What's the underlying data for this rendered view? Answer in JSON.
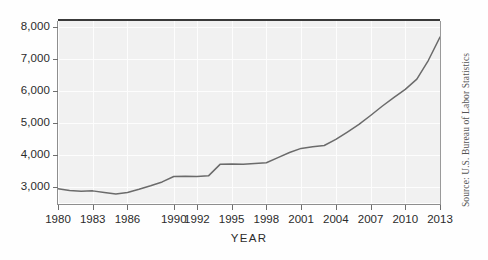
{
  "figure": {
    "source_note": "Source: U.S. Bureau of Labor Statistics",
    "xaxis_title": "YEAR",
    "background_color": "#f1f1f1",
    "line_color": "#6b6b6b",
    "grid_color": "#fdfdfd",
    "text_color": "#2b2b2b"
  },
  "chart_data": {
    "type": "line",
    "title": "",
    "subtitle": "",
    "xlabel": "YEAR",
    "ylabel": "",
    "xlim": [
      1980,
      2013
    ],
    "ylim": [
      2500,
      8200
    ],
    "grid": true,
    "legend": "none",
    "annotations": [
      "Source: U.S. Bureau of Labor Statistics"
    ],
    "xtick_labels": [
      "1980",
      "1983",
      "1986",
      "1990",
      "1992",
      "1995",
      "1998",
      "2001",
      "2004",
      "2007",
      "2010",
      "2013"
    ],
    "xtick_values": [
      1980,
      1983,
      1986,
      1990,
      1992,
      1995,
      1998,
      2001,
      2004,
      2007,
      2010,
      2013
    ],
    "ytick_labels": [
      "3,000",
      "4,000",
      "5,000",
      "6,000",
      "7,000",
      "8,000"
    ],
    "ytick_values": [
      3000,
      4000,
      5000,
      6000,
      7000,
      8000
    ],
    "x": [
      1980,
      1981,
      1982,
      1983,
      1984,
      1985,
      1986,
      1987,
      1988,
      1989,
      1990,
      1991,
      1992,
      1993,
      1994,
      1995,
      1996,
      1997,
      1998,
      1999,
      2000,
      2001,
      2002,
      2003,
      2004,
      2005,
      2006,
      2007,
      2008,
      2009,
      2010,
      2011,
      2012,
      2013
    ],
    "series": [
      {
        "name": "value",
        "values": [
          2950,
          2890,
          2870,
          2880,
          2830,
          2780,
          2830,
          2930,
          3040,
          3160,
          3330,
          3340,
          3330,
          3350,
          3710,
          3720,
          3710,
          3740,
          3760,
          3920,
          4080,
          4210,
          4260,
          4300,
          4490,
          4720,
          4960,
          5240,
          5530,
          5800,
          6060,
          6380,
          6970,
          7700
        ]
      }
    ]
  }
}
